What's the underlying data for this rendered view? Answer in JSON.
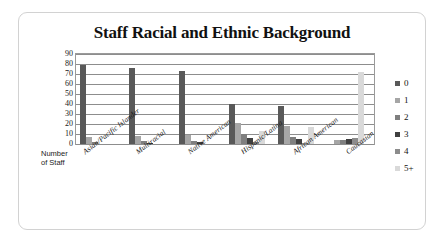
{
  "chart_data": {
    "type": "bar",
    "title": "Staff Racial and Ethnic Background",
    "xlabel": "",
    "ylabel": "Number of Staff",
    "ylim": [
      0,
      90
    ],
    "yticks": [
      0,
      10,
      20,
      30,
      40,
      50,
      60,
      70,
      80,
      90
    ],
    "grid": true,
    "legend_position": "right",
    "categories": [
      "Asian/Pacific Islander",
      "Multiracial",
      "Native American",
      "Hispanic/Latina",
      "African American",
      "Caucasian"
    ],
    "series": [
      {
        "name": "0",
        "color": "#595959",
        "values": [
          79,
          76,
          73,
          40,
          38,
          0
        ]
      },
      {
        "name": "1",
        "color": "#a6a6a6",
        "values": [
          7,
          8,
          9,
          21,
          18,
          4
        ]
      },
      {
        "name": "2",
        "color": "#7f7f7f",
        "values": [
          2,
          3,
          3,
          10,
          7,
          4
        ]
      },
      {
        "name": "3",
        "color": "#404040",
        "values": [
          0,
          1,
          2,
          6,
          5,
          5
        ]
      },
      {
        "name": "4",
        "color": "#8c8c8c",
        "values": [
          0,
          0,
          0,
          2,
          1,
          6
        ]
      },
      {
        "name": "5+",
        "color": "#d9d9d9",
        "values": [
          0,
          0,
          0,
          13,
          17,
          72
        ]
      }
    ]
  },
  "axis_caption": {
    "line1": "Number",
    "line2": "of Staff"
  },
  "legend": {
    "items": [
      {
        "label": "0"
      },
      {
        "label": "1"
      },
      {
        "label": "2"
      },
      {
        "label": "3"
      },
      {
        "label": "4"
      },
      {
        "label": "5+"
      }
    ]
  }
}
